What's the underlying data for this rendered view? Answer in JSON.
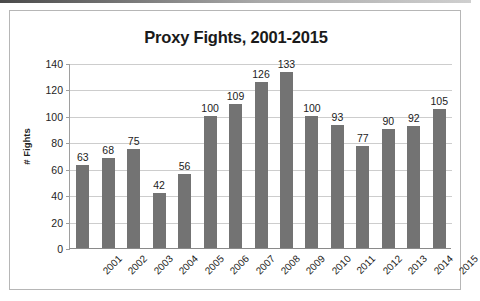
{
  "chart_data": {
    "type": "bar",
    "title": "Proxy Fights, 2001-2015",
    "xlabel": "",
    "ylabel": "# Fights",
    "categories": [
      "2001",
      "2002",
      "2003",
      "2004",
      "2005",
      "2006",
      "2007",
      "2008",
      "2009",
      "2010",
      "2011",
      "2012",
      "2013",
      "2014",
      "2015"
    ],
    "values": [
      63,
      68,
      75,
      42,
      56,
      100,
      109,
      126,
      133,
      100,
      93,
      77,
      90,
      92,
      105
    ],
    "series": [
      {
        "name": "# Fights",
        "values": [
          63,
          68,
          75,
          42,
          56,
          100,
          109,
          126,
          133,
          100,
          93,
          77,
          90,
          92,
          105
        ]
      }
    ],
    "ylim": [
      0,
      140
    ],
    "yticks": [
      0,
      20,
      40,
      60,
      80,
      100,
      120,
      140
    ],
    "ytick_labels": [
      "0",
      "20",
      "40",
      "60",
      "80",
      "100",
      "120",
      "140"
    ],
    "grid": "horizontal",
    "legend": "none",
    "bar_color": "#737373",
    "gridline_color": "#cdcdcd",
    "axis_color": "#8a8a8a",
    "title_color": "#1a1a1a",
    "data_labels": [
      "63",
      "68",
      "75",
      "42",
      "56",
      "100",
      "109",
      "126",
      "133",
      "100",
      "93",
      "77",
      "90",
      "92",
      "105"
    ]
  }
}
